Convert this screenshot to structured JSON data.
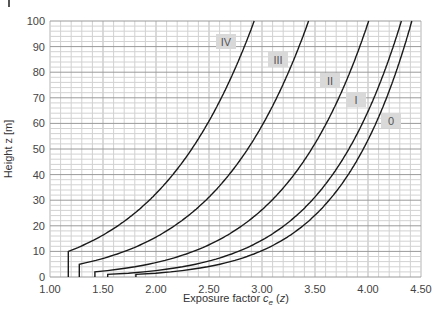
{
  "chart_data": {
    "type": "line",
    "title": "",
    "xlabel": "Exposure factor c_e (z)",
    "xlabel_parts": {
      "prefix": "Exposure factor ",
      "sym": "c",
      "sub": "e",
      "suffix": " (z)"
    },
    "ylabel": "Height z [m]",
    "xlim": [
      1.0,
      4.5
    ],
    "ylim": [
      0,
      100
    ],
    "x_ticks": [
      "1.00",
      "1.50",
      "2.00",
      "2.50",
      "3.00",
      "3.50",
      "4.00",
      "4.50"
    ],
    "y_ticks": [
      "0",
      "10",
      "20",
      "30",
      "40",
      "50",
      "60",
      "70",
      "80",
      "90",
      "100"
    ],
    "grid": true,
    "legend_position": "inline labels",
    "series": [
      {
        "name": "0",
        "z_min": 1,
        "z0": 0.003,
        "kr": 0.156,
        "label_box": [
          381,
          113
        ],
        "points": [
          [
            1.76,
            0
          ],
          [
            1.76,
            1
          ],
          [
            2.37,
            5
          ],
          [
            2.73,
            10
          ],
          [
            3.39,
            20
          ],
          [
            3.66,
            30
          ],
          [
            3.92,
            50
          ],
          [
            4.2,
            75
          ],
          [
            4.41,
            100
          ]
        ]
      },
      {
        "name": "I",
        "z_min": 1,
        "z0": 0.01,
        "kr": 0.17,
        "label_box": [
          346,
          92
        ],
        "points": [
          [
            1.55,
            0
          ],
          [
            1.55,
            1
          ],
          [
            2.13,
            5
          ],
          [
            2.48,
            10
          ],
          [
            3.11,
            20
          ],
          [
            3.38,
            30
          ],
          [
            3.79,
            50
          ],
          [
            4.09,
            75
          ],
          [
            4.32,
            100
          ]
        ]
      },
      {
        "name": "II",
        "z_min": 2,
        "z0": 0.05,
        "kr": 0.19,
        "label_box": [
          320,
          73
        ],
        "points": [
          [
            1.42,
            0
          ],
          [
            1.42,
            2
          ],
          [
            1.83,
            5
          ],
          [
            2.18,
            10
          ],
          [
            2.79,
            20
          ],
          [
            3.07,
            30
          ],
          [
            3.46,
            50
          ],
          [
            3.76,
            75
          ],
          [
            4.01,
            100
          ]
        ]
      },
      {
        "name": "III",
        "z_min": 5,
        "z0": 0.3,
        "kr": 0.215,
        "label_box": [
          268,
          52
        ],
        "points": [
          [
            1.28,
            0
          ],
          [
            1.28,
            5
          ],
          [
            1.71,
            10
          ],
          [
            2.22,
            20
          ],
          [
            2.51,
            30
          ],
          [
            2.9,
            50
          ],
          [
            3.2,
            75
          ],
          [
            3.44,
            100
          ]
        ]
      },
      {
        "name": "IV",
        "z_min": 10,
        "z0": 1.0,
        "kr": 0.234,
        "label_box": [
          216,
          34
        ],
        "points": [
          [
            1.17,
            0
          ],
          [
            1.17,
            10
          ],
          [
            1.68,
            20
          ],
          [
            1.96,
            30
          ],
          [
            2.37,
            50
          ],
          [
            2.67,
            75
          ],
          [
            2.93,
            100
          ]
        ]
      }
    ],
    "colors": {
      "line": "#1a1a1a",
      "grid_major": "#9a9a9a",
      "grid_minor": "#d2d2d2",
      "label_box": "#d9d9d9"
    }
  }
}
